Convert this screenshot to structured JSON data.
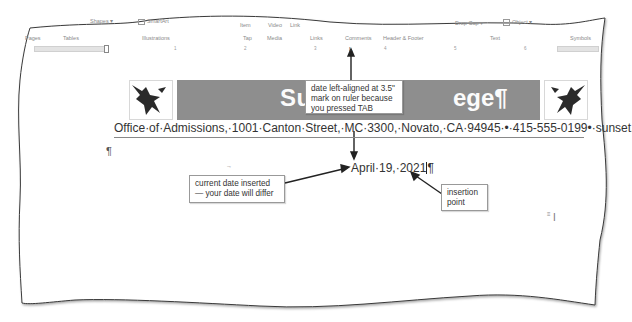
{
  "ribbon": {
    "top_row": [
      {
        "label": "Shapes ▾",
        "x": 90,
        "y": 20
      },
      {
        "label": "SmartArt",
        "x": 143,
        "y": 20
      },
      {
        "label": "Item",
        "x": 240,
        "y": 23
      },
      {
        "label": "Video",
        "x": 268,
        "y": 23
      },
      {
        "label": "Link",
        "x": 290,
        "y": 23
      },
      {
        "label": "Drop Cap ▾",
        "x": 455,
        "y": 21
      },
      {
        "label": "Object ▾",
        "x": 510,
        "y": 20
      }
    ],
    "groups": [
      {
        "label": "Pages",
        "x": 23
      },
      {
        "label": "Tables",
        "x": 63
      },
      {
        "label": "Illustrations",
        "x": 142
      },
      {
        "label": "Tap",
        "x": 243
      },
      {
        "label": "Media",
        "x": 269
      },
      {
        "label": "Links",
        "x": 310
      },
      {
        "label": "Comments",
        "x": 345
      },
      {
        "label": "Header & Footer",
        "x": 385
      },
      {
        "label": "Text",
        "x": 490
      },
      {
        "label": "Symbols",
        "x": 572
      }
    ]
  },
  "ruler": {
    "marks": [
      "1",
      "2",
      "3",
      "4",
      "5",
      "6"
    ]
  },
  "document": {
    "letterhead": {
      "title_left": "Sunset",
      "title_right": "ege¶",
      "address": "Office·of·Admissions,·1001·Canton·Street,·MC·3300,·Novato,·CA·94945·•·415-555-0199•·sunset.edu¶"
    },
    "empty_paragraph": "¶",
    "tab_marker": "→",
    "date": "April·19,·2021",
    "date_pilcrow": "¶"
  },
  "callouts": {
    "tab": "date left-aligned at 3.5\" mark on ruler because you pressed TAB",
    "current_date": "current date inserted — your date will differ",
    "insertion_point": "insertion point"
  }
}
